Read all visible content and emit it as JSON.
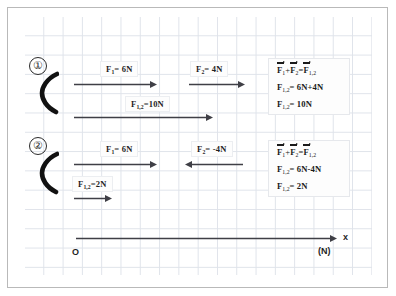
{
  "figure": {
    "colors": {
      "arrow": "#3f3f46",
      "brace": "#111111",
      "grid_line": "#dfe3ea",
      "frame": "#b9b9b9",
      "text": "#1a1a1a"
    }
  },
  "rows": [
    {
      "marker": "①",
      "forces": [
        {
          "label_f": "F",
          "label_sub": "1",
          "label_rest": "= 6N",
          "direction": "right",
          "magnitude_n": 6
        },
        {
          "label_f": "F",
          "label_sub": "2",
          "label_rest": "= 4N",
          "direction": "right",
          "magnitude_n": 4
        }
      ],
      "resultant": {
        "label_f": "F",
        "label_sub": "1,2",
        "label_rest": "=10N",
        "direction": "right",
        "magnitude_n": 10
      },
      "result_box": {
        "line1_a": "F",
        "line1_a_sub": "1",
        "line1_b": "+",
        "line1_c": "F",
        "line1_c_sub": "2",
        "line1_d": "=",
        "line1_e": "F",
        "line1_e_sub": "1,2",
        "line2_f": "F",
        "line2_sub": "1,2",
        "line2_rest": "= 6N+4N",
        "line3_f": "F",
        "line3_sub": "1,2",
        "line3_rest": "= 10N"
      }
    },
    {
      "marker": "②",
      "forces": [
        {
          "label_f": "F",
          "label_sub": "1",
          "label_rest": "= 6N",
          "direction": "right",
          "magnitude_n": 6
        },
        {
          "label_f": "F",
          "label_sub": "2",
          "label_rest": "= -4N",
          "direction": "left",
          "magnitude_n": -4
        }
      ],
      "resultant": {
        "label_f": "F",
        "label_sub": "1,2",
        "label_rest": "=2N",
        "direction": "right",
        "magnitude_n": 2
      },
      "result_box": {
        "line1_a": "F",
        "line1_a_sub": "1",
        "line1_b": "+",
        "line1_c": "F",
        "line1_c_sub": "2",
        "line1_d": "=",
        "line1_e": "F",
        "line1_e_sub": "1,2",
        "line2_f": "F",
        "line2_sub": "1,2",
        "line2_rest": "= 6N-4N",
        "line3_f": "F",
        "line3_sub": "1,2",
        "line3_rest": "= 2N"
      }
    }
  ],
  "axis": {
    "origin_label": "O",
    "axis_name": "x",
    "unit_label": "(N)"
  }
}
